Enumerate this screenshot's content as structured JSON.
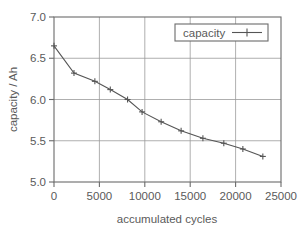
{
  "chart_data": {
    "type": "line",
    "title": "",
    "subtitle": "",
    "xlabel": "accumulated cycles",
    "ylabel": "capacity / Ah",
    "xlim": [
      0,
      25000
    ],
    "ylim": [
      5.0,
      7.0
    ],
    "xticks": [
      0,
      5000,
      10000,
      15000,
      20000,
      25000
    ],
    "xticklabels": [
      "0",
      "5000",
      "10000",
      "15000",
      "20000",
      "25000"
    ],
    "yticks": [
      5.0,
      5.5,
      6.0,
      6.5,
      7.0
    ],
    "yticklabels": [
      "5.0",
      "5.5",
      "6.0",
      "6.5",
      "7.0"
    ],
    "grid": true,
    "grid_axis": "both",
    "legend": {
      "position": "top-right",
      "entries": [
        {
          "label": "capacity",
          "marker": "plus",
          "line": "solid",
          "color": "#555555"
        }
      ]
    },
    "series": [
      {
        "name": "capacity",
        "color": "#555555",
        "marker": "plus",
        "x": [
          0,
          2200,
          4500,
          6200,
          8100,
          9700,
          11800,
          14000,
          16400,
          18700,
          20800,
          23000
        ],
        "y": [
          6.65,
          6.32,
          6.22,
          6.12,
          6.0,
          5.85,
          5.73,
          5.62,
          5.53,
          5.47,
          5.4,
          5.31
        ]
      }
    ],
    "annotations": [],
    "colors": {
      "axis": "#6b6b6b",
      "grid": "#9a9a9a",
      "line": "#555555",
      "text": "#5a5a5a",
      "background": "#ffffff"
    }
  },
  "legend_box": {
    "label": "capacity"
  },
  "axes": {
    "x_title": "accumulated cycles",
    "y_title": "capacity / Ah",
    "x_labels": [
      "0",
      "5000",
      "10000",
      "15000",
      "20000",
      "25000"
    ],
    "y_labels": [
      "5.0",
      "5.5",
      "6.0",
      "6.5",
      "7.0"
    ]
  }
}
